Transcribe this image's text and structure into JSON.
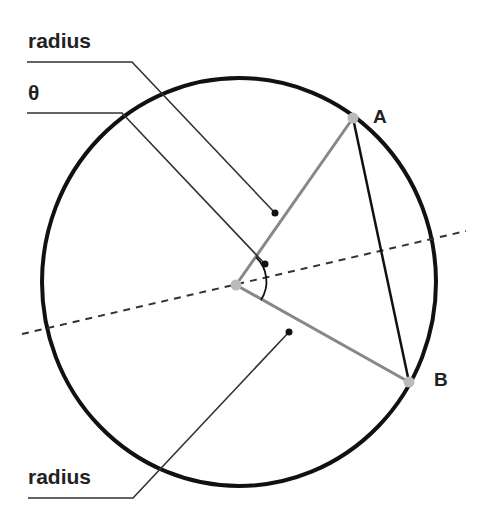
{
  "diagram": {
    "labels": {
      "radius_top": "radius",
      "theta": "θ",
      "radius_bottom": "radius",
      "point_a": "A",
      "point_b": "B"
    },
    "colors": {
      "circle": "#111111",
      "radius_line": "#888888",
      "chord": "#111111",
      "point": "#bbbbbb",
      "leader": "#333333",
      "dashed_axis": "#333333",
      "label": "#222222"
    },
    "geometry": {
      "circle": {
        "cx": 239,
        "cy": 282,
        "rx": 197,
        "ry": 204
      },
      "center_point": {
        "x": 236,
        "y": 285
      },
      "point_a": {
        "x": 353,
        "y": 118
      },
      "point_b": {
        "x": 409,
        "y": 382
      },
      "dashed_axis": {
        "x1": 22,
        "y1": 334,
        "x2": 466,
        "y2": 231
      }
    }
  }
}
